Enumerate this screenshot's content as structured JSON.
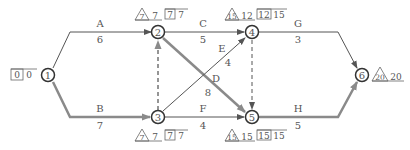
{
  "diagram": {
    "colors": {
      "normal": "#555555",
      "critical": "#8a8a8a",
      "text": "#555555"
    },
    "nodes": [
      {
        "id": "1",
        "label": "1"
      },
      {
        "id": "2",
        "label": "2"
      },
      {
        "id": "3",
        "label": "3"
      },
      {
        "id": "4",
        "label": "4"
      },
      {
        "id": "5",
        "label": "5"
      },
      {
        "id": "6",
        "label": "6"
      }
    ],
    "activities": [
      {
        "name": "A",
        "duration": "6",
        "from": "1",
        "to": "2",
        "critical": false
      },
      {
        "name": "B",
        "duration": "7",
        "from": "1",
        "to": "3",
        "critical": true
      },
      {
        "name": "C",
        "duration": "5",
        "from": "2",
        "to": "4",
        "critical": false
      },
      {
        "name": "D",
        "duration": "8",
        "from": "2",
        "to": "5",
        "critical": true
      },
      {
        "name": "E",
        "duration": "4",
        "from": "3",
        "to": "4",
        "critical": false
      },
      {
        "name": "F",
        "duration": "4",
        "from": "3",
        "to": "5",
        "critical": false
      },
      {
        "name": "G",
        "duration": "3",
        "from": "4",
        "to": "6",
        "critical": false
      },
      {
        "name": "H",
        "duration": "5",
        "from": "5",
        "to": "6",
        "critical": true
      }
    ],
    "dummies": [
      {
        "from": "3",
        "to": "2",
        "critical": true
      },
      {
        "from": "4",
        "to": "5",
        "critical": false
      }
    ],
    "annotations": {
      "n1": {
        "box": "0",
        "after_box": "0"
      },
      "n2": {
        "tri": "7",
        "after_tri": "7",
        "box": "7",
        "after_box": "7"
      },
      "n3": {
        "tri": "7",
        "after_tri": "7",
        "box": "7",
        "after_box": "7"
      },
      "n4": {
        "tri": "15",
        "after_tri": "12",
        "box": "12",
        "after_box": "15"
      },
      "n5": {
        "tri": "15",
        "after_tri": "15",
        "box": "15",
        "after_box": "15"
      },
      "n6": {
        "tri": "20",
        "after_tri": "20"
      }
    }
  }
}
